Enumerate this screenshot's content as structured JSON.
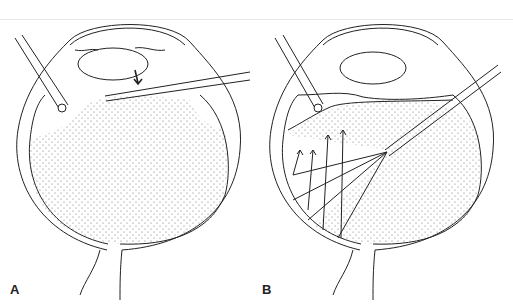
{
  "figure": {
    "panels": [
      {
        "id": "A",
        "label": "A"
      },
      {
        "id": "B",
        "label": "B"
      }
    ],
    "colors": {
      "line": "#222222",
      "stipple": "#555555",
      "background": "#ffffff"
    }
  }
}
